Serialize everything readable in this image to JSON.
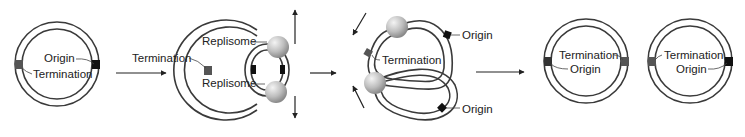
{
  "figure": {
    "stages": [
      {
        "id": "stage-1",
        "labels": {
          "origin": "Origin",
          "termination": "Termination"
        }
      },
      {
        "id": "stage-2",
        "labels": {
          "termination": "Termination",
          "replisome_top": "Replisome",
          "replisome_bottom": "Replisome"
        }
      },
      {
        "id": "stage-3",
        "labels": {
          "origin_top": "Origin",
          "termination": "Termination",
          "origin_bottom": "Origin"
        }
      },
      {
        "id": "stage-4a",
        "labels": {
          "termination": "Termination",
          "origin": "Origin"
        }
      },
      {
        "id": "stage-4b",
        "labels": {
          "termination": "Termination",
          "origin": "Origin"
        }
      }
    ],
    "arrows": [
      "stage-1 -> stage-2",
      "stage-2 -> stage-3",
      "stage-3 -> stage-4"
    ],
    "colors": {
      "strand": "#3a3a3a",
      "replisome": "#bdbdbd",
      "marker": "#222222",
      "text": "#222222"
    }
  }
}
